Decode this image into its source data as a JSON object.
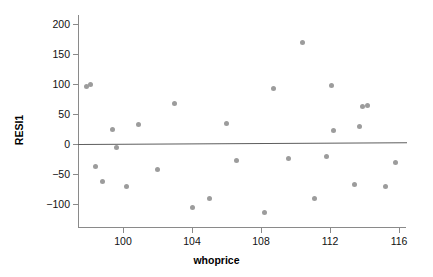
{
  "chart_data": {
    "type": "scatter",
    "title": "",
    "xlabel": "whoprice",
    "ylabel": "RESI1",
    "xlim": [
      97.4,
      116.5
    ],
    "ylim": [
      -123,
      200
    ],
    "grid": false,
    "legend": null,
    "x_ticks": [
      100,
      104,
      108,
      112,
      116
    ],
    "y_ticks": [
      200,
      150,
      100,
      50,
      0,
      -50,
      -100
    ],
    "reference_line": {
      "y_start": 0,
      "y_end": 3,
      "x_start": 97.4,
      "x_end": 116.5,
      "color": "#5d5d5d"
    },
    "marker": {
      "shape": "circle",
      "color": "#9c9c9c",
      "size": 5
    },
    "points": [
      {
        "x": 97.9,
        "y": 96
      },
      {
        "x": 98.1,
        "y": 99
      },
      {
        "x": 98.4,
        "y": -38
      },
      {
        "x": 98.8,
        "y": -63
      },
      {
        "x": 99.4,
        "y": 25
      },
      {
        "x": 99.6,
        "y": -6
      },
      {
        "x": 100.2,
        "y": -70
      },
      {
        "x": 100.9,
        "y": 33
      },
      {
        "x": 102.0,
        "y": -42
      },
      {
        "x": 103.0,
        "y": 68
      },
      {
        "x": 104.0,
        "y": -106
      },
      {
        "x": 105.0,
        "y": -90
      },
      {
        "x": 106.0,
        "y": 34
      },
      {
        "x": 106.6,
        "y": -28
      },
      {
        "x": 108.2,
        "y": -114
      },
      {
        "x": 108.7,
        "y": 93
      },
      {
        "x": 109.6,
        "y": -24
      },
      {
        "x": 110.4,
        "y": 170
      },
      {
        "x": 111.1,
        "y": -91
      },
      {
        "x": 111.8,
        "y": -21
      },
      {
        "x": 112.1,
        "y": 97
      },
      {
        "x": 112.2,
        "y": 23
      },
      {
        "x": 113.4,
        "y": -68
      },
      {
        "x": 113.7,
        "y": 30
      },
      {
        "x": 113.9,
        "y": 62
      },
      {
        "x": 114.2,
        "y": 64
      },
      {
        "x": 115.2,
        "y": -70
      },
      {
        "x": 115.8,
        "y": -30
      }
    ]
  }
}
